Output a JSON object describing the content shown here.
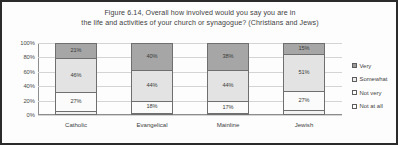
{
  "chart_data": {
    "type": "bar",
    "subtype": "stacked-percent-column",
    "title": "Figure 6.14, Overall how involved would you say you are in the life and activities of your church or synagogue? (Christians and Jews)",
    "title_line1": "Figure 6.14, Overall how involved would you say you are in",
    "title_line2": "the life and activities of your church or synagogue? (Christians and Jews)",
    "xlabel": "",
    "ylabel": "",
    "ylim": [
      0,
      100
    ],
    "ytick_labels": [
      "100%",
      "80%",
      "60%",
      "40%",
      "20%",
      "0%"
    ],
    "ytick_values": [
      100,
      80,
      60,
      40,
      20,
      0
    ],
    "grid": true,
    "legend_position": "right",
    "categories": [
      "Catholic",
      "Evangelical",
      "Mainline",
      "Jewish"
    ],
    "series": [
      {
        "name": "Very",
        "color": "#a6a6a6",
        "values": [
          21,
          40,
          38,
          15
        ],
        "labels": [
          "21%",
          "40%",
          "38%",
          "15%"
        ]
      },
      {
        "name": "Somewhat",
        "color": "#e3e3e3",
        "values": [
          47,
          44,
          44,
          51
        ],
        "labels": [
          "46%",
          "44%",
          "44%",
          "51%"
        ]
      },
      {
        "name": "Not very",
        "color": "#fbfbfb",
        "values": [
          27,
          18,
          17,
          27
        ],
        "labels": [
          "27%",
          "18%",
          "17%",
          "27%"
        ]
      },
      {
        "name": "Not at all",
        "color": "#f2f2f2",
        "values": [
          5,
          3,
          1,
          7
        ],
        "labels": [
          "5%",
          "3%",
          "1%",
          "7%"
        ]
      }
    ]
  },
  "legend": {
    "items": [
      {
        "label": "Very"
      },
      {
        "label": "Somewhat"
      },
      {
        "label": "Not very"
      },
      {
        "label": "Not at all"
      }
    ]
  }
}
